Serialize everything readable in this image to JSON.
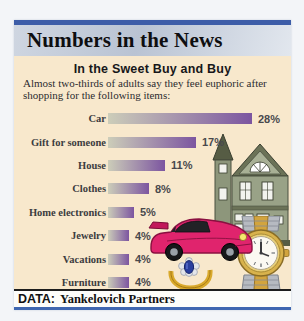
{
  "masthead": {
    "title": "Numbers in the News"
  },
  "chart_data": {
    "type": "bar",
    "orientation": "horizontal",
    "title": "In the Sweet Buy and Buy",
    "subtitle": "Almost two-thirds of adults say they feel euphoric after shopping for the following items:",
    "subtitle_lines": [
      "Almost two-thirds of adults say they feel euphoric after",
      "shopping for the following items:"
    ],
    "categories": [
      "Car",
      "Gift for someone",
      "House",
      "Clothes",
      "Home electronics",
      "Jewelry",
      "Vacations",
      "Furniture"
    ],
    "values": [
      28,
      17,
      11,
      8,
      5,
      4,
      4,
      4
    ],
    "value_labels": [
      "28%",
      "17%",
      "11%",
      "8%",
      "5%",
      "4%",
      "4%",
      "4%"
    ],
    "xlim": [
      0,
      30
    ],
    "grid": false,
    "legend": "none",
    "bar_gradient": [
      "#cccdb9",
      "#7c55a0"
    ]
  },
  "footer": {
    "label": "DATA:",
    "source": "Yankelovich Partners"
  },
  "colors": {
    "top_bar": "#3d5da8",
    "masthead_bg": "#c3ccda",
    "content_bg": "#f8e8cc",
    "footer_rule_blue": "#4067b0",
    "bar_start": "#cccdb9",
    "bar_end": "#7c55a0"
  },
  "illustrations": [
    {
      "name": "house-illustration",
      "desc": "green Victorian house"
    },
    {
      "name": "car-illustration",
      "desc": "pink sports car"
    },
    {
      "name": "ring-illustration",
      "desc": "gold ring with blue sapphire"
    },
    {
      "name": "watch-illustration",
      "desc": "two-tone gold and steel wristwatch"
    }
  ]
}
